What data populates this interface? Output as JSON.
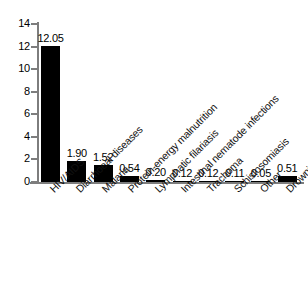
{
  "chart_data": {
    "type": "bar",
    "title": "",
    "subtitle": "",
    "xlabel": "",
    "ylabel": "",
    "ylim": [
      0,
      14
    ],
    "yticks": [
      0,
      2,
      4,
      6,
      8,
      10,
      12,
      14
    ],
    "ytick_labels": [
      "0",
      "2",
      "4",
      "6",
      "8",
      "10",
      "12",
      "14"
    ],
    "grid": false,
    "legend": false,
    "bar_color": "#000000",
    "axis_color": "#7d7d7d",
    "background": "#ffffff",
    "label_rotation_deg": -45,
    "categories": [
      "HIV/AIDS",
      "Diarrhoeal diseases",
      "Malaria",
      "Protein-energy malnutrition",
      "Lymphatic filariasis",
      "Intestinal nematode infections",
      "Trachoma",
      "Schistosomiasis",
      "Other",
      "Drownings"
    ],
    "values": [
      12.05,
      1.9,
      1.52,
      0.54,
      0.2,
      0.12,
      0.12,
      0.11,
      0.05,
      0.51
    ],
    "value_labels": [
      "12.05",
      "1.90",
      "1.52",
      "0.54",
      "0.20",
      "0.12",
      "0.12",
      "0.11",
      "0.05",
      "0.51"
    ]
  }
}
